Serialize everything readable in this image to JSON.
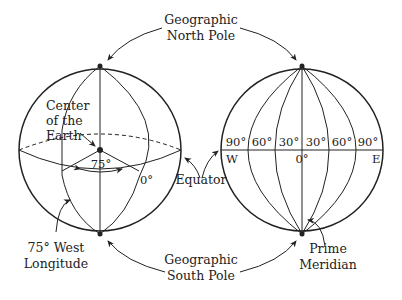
{
  "diagram": {
    "labels": {
      "north_pole": [
        "Geographic",
        "North Pole"
      ],
      "south_pole": [
        "Geographic",
        "South Pole"
      ],
      "center": [
        "Center",
        "of the",
        "Earth"
      ],
      "angle": "75°",
      "zero_left": "0°",
      "equator": "Equator",
      "west_longitude": [
        "75° West",
        "Longitude"
      ],
      "prime_meridian": [
        "Prime",
        "Meridian"
      ],
      "west": "W",
      "east": "E",
      "zero_right": "0°"
    },
    "meridian_labels": [
      "90°",
      "60°",
      "30°",
      "30°",
      "60°",
      "90°"
    ],
    "colors": {
      "line": "#222222",
      "background": "#ffffff"
    }
  }
}
